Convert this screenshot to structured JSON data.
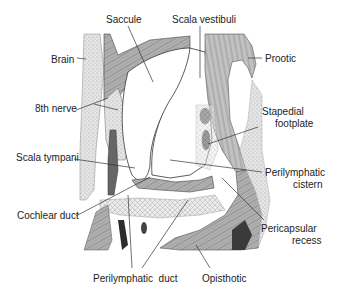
{
  "diagram": {
    "type": "anatomical-cross-section",
    "colors": {
      "line": "#333333",
      "tissue_light": "#d8d8d8",
      "tissue_mid": "#a8a8a8",
      "tissue_dark": "#555555",
      "background": "#ffffff"
    },
    "labels": {
      "saccule": "Saccule",
      "scala_vestibuli": "Scala vestibuli",
      "brain": "Brain",
      "prootic": "Prootic",
      "eighth_nerve": "8th nerve",
      "stapedial_footplate_1": "Stapedial",
      "stapedial_footplate_2": "footplate",
      "scala_tympani": "Scala tympani",
      "perilymphatic_cistern_1": "Perilymphatic",
      "perilymphatic_cistern_2": "cistern",
      "cochlear_duct": "Cochlear duct",
      "pericapsular_recess_1": "Pericapsular",
      "pericapsular_recess_2": "recess",
      "perilymphatic_duct": "Perilymphatic  duct",
      "opisthotic": "Opisthotic"
    }
  }
}
